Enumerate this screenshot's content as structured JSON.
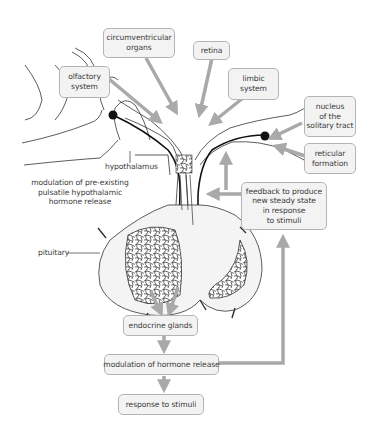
{
  "diagram": {
    "colors": {
      "box_fill": "#f3f3f3",
      "box_border": "#b4b4b4",
      "arrow": "#a9a9a9",
      "line": "#333333",
      "text": "#3b3b3b",
      "background": "#ffffff"
    },
    "input_boxes": [
      {
        "id": "circumventricular",
        "lines": [
          "circumventricular",
          "organs"
        ]
      },
      {
        "id": "retina",
        "lines": [
          "retina"
        ]
      },
      {
        "id": "olfactory",
        "lines": [
          "olfactory",
          "system"
        ]
      },
      {
        "id": "limbic",
        "lines": [
          "limbic",
          "system"
        ]
      },
      {
        "id": "nucleus",
        "lines": [
          "nucleus",
          "of the",
          "solitary tract"
        ]
      },
      {
        "id": "reticular",
        "lines": [
          "reticular",
          "formation"
        ]
      }
    ],
    "feedback_box": {
      "lines": [
        "feedback to produce",
        "new steady state",
        "in response",
        "to stimuli"
      ]
    },
    "labels": {
      "hypothalamus": "hypothalamus",
      "modulation_preexisting": [
        "modulation of pre-existing",
        "pulsatile hypothalamic",
        "hormone release"
      ],
      "pituitary": "pituitary"
    },
    "flow_boxes": [
      {
        "id": "endocrine",
        "label": "endocrine glands"
      },
      {
        "id": "modulation",
        "label": "modulation of hormone release"
      },
      {
        "id": "response",
        "label": "response to stimuli"
      }
    ]
  }
}
